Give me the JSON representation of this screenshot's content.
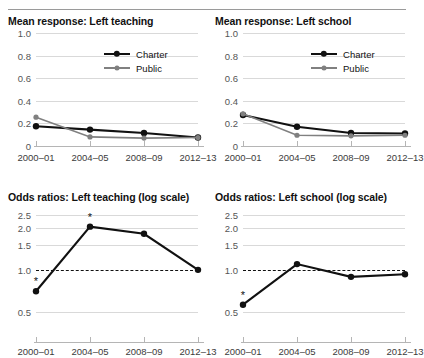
{
  "figure": {
    "categories": [
      "2000–01",
      "2004–05",
      "2008–09",
      "2012–13"
    ],
    "colors": {
      "charter": "#111111",
      "public": "#808080",
      "grid": "#d9d9d9",
      "axis": "#b5b5b5"
    }
  },
  "legend": {
    "charter_label": "Charter",
    "public_label": "Public"
  },
  "panels": {
    "top_left": {
      "title": "Mean response: Left teaching"
    },
    "top_right": {
      "title": "Mean response: Left school"
    },
    "bottom_left": {
      "title": "Odds ratios: Left teaching (log scale)"
    },
    "bottom_right": {
      "title": "Odds ratios: Left school (log scale)"
    }
  },
  "yticks": {
    "mean": [
      "1.0",
      "0.8",
      "0.6",
      "0.4",
      "0.2",
      "0"
    ],
    "odds": [
      "2.5",
      "2.0",
      "1.5",
      "1.0",
      "0.5"
    ]
  },
  "chart_data": [
    {
      "type": "line",
      "title": "Mean response: Left teaching",
      "xlabel": "",
      "ylabel": "",
      "categories": [
        "2000–01",
        "2004–05",
        "2008–09",
        "2012–13"
      ],
      "ylim": [
        0,
        1.0
      ],
      "yticks": [
        0,
        0.2,
        0.4,
        0.6,
        0.8,
        1.0
      ],
      "scale": "linear",
      "grid": true,
      "legend_position": "top-right",
      "series": [
        {
          "name": "Charter",
          "color": "#111111",
          "values": [
            0.175,
            0.145,
            0.115,
            0.075
          ]
        },
        {
          "name": "Public",
          "color": "#808080",
          "values": [
            0.255,
            0.08,
            0.07,
            0.075
          ]
        }
      ]
    },
    {
      "type": "line",
      "title": "Mean response: Left school",
      "xlabel": "",
      "ylabel": "",
      "categories": [
        "2000–01",
        "2004–05",
        "2008–09",
        "2012–13"
      ],
      "ylim": [
        0,
        1.0
      ],
      "yticks": [
        0,
        0.2,
        0.4,
        0.6,
        0.8,
        1.0
      ],
      "scale": "linear",
      "grid": true,
      "legend_position": "top-right",
      "series": [
        {
          "name": "Charter",
          "color": "#111111",
          "values": [
            0.275,
            0.17,
            0.115,
            0.11
          ]
        },
        {
          "name": "Public",
          "color": "#808080",
          "values": [
            0.285,
            0.095,
            0.09,
            0.095
          ]
        }
      ]
    },
    {
      "type": "line",
      "title": "Odds ratios: Left teaching (log scale)",
      "xlabel": "",
      "ylabel": "",
      "categories": [
        "2000–01",
        "2004–05",
        "2008–09",
        "2012–13"
      ],
      "ylim": [
        0.42,
        2.75
      ],
      "yticks": [
        0.5,
        1.0,
        1.5,
        2.0,
        2.5
      ],
      "scale": "log",
      "grid": true,
      "reference_line": 1.0,
      "reference_line_style": "dashed",
      "series": [
        {
          "name": "Odds ratio",
          "color": "#111111",
          "values": [
            0.7,
            2.05,
            1.82,
            1.0
          ]
        }
      ],
      "annotations": [
        {
          "category": "2000–01",
          "value": 0.7,
          "marker": "*"
        },
        {
          "category": "2004–05",
          "value": 2.05,
          "marker": "*"
        }
      ]
    },
    {
      "type": "line",
      "title": "Odds ratios: Left school (log scale)",
      "xlabel": "",
      "ylabel": "",
      "categories": [
        "2000–01",
        "2004–05",
        "2008–09",
        "2012–13"
      ],
      "ylim": [
        0.42,
        2.75
      ],
      "yticks": [
        0.5,
        1.0,
        1.5,
        2.0,
        2.5
      ],
      "scale": "log",
      "grid": true,
      "reference_line": 1.0,
      "reference_line_style": "dashed",
      "series": [
        {
          "name": "Odds ratio",
          "color": "#111111",
          "values": [
            0.56,
            1.1,
            0.89,
            0.93
          ]
        }
      ],
      "annotations": [
        {
          "category": "2000–01",
          "value": 0.56,
          "marker": "*"
        }
      ]
    }
  ]
}
